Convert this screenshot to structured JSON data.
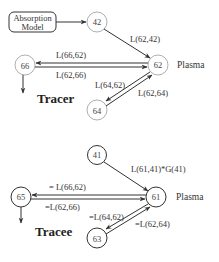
{
  "tracer": {
    "title": "Tracer",
    "absorption_box": {
      "line1": "Absorption",
      "line2": "Model"
    },
    "nodes": {
      "n42": "42",
      "n62": "62",
      "n66": "66",
      "n64": "64"
    },
    "plasma_label": "Plasma",
    "edges": {
      "e_62_42": "L(62,42)",
      "e_66_62": "L(66,62)",
      "e_62_66": "L(62,66)",
      "e_64_62": "L(64,62)",
      "e_62_64": "L(62,64)"
    }
  },
  "tracee": {
    "title": "Tracee",
    "nodes": {
      "n41": "41",
      "n61": "61",
      "n65": "65",
      "n63": "63"
    },
    "plasma_label": "Plasma",
    "edges": {
      "e_61_41": "L(61,41)*G(41)",
      "e_66_62": "= L(66,62)",
      "e_62_66": "=L(62,66)",
      "e_64_62": "=L(64,62)",
      "e_62_64": "=L(62,64)"
    }
  },
  "colors": {
    "tracer_stroke": "#9a9a9a",
    "tracee_stroke": "#333333",
    "arrow": "#333333"
  }
}
